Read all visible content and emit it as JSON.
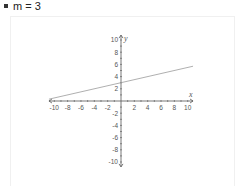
{
  "title": "m = 3",
  "chart_data": {
    "type": "line",
    "title": "m = 3",
    "xlabel": "x",
    "ylabel": "y",
    "xlim": [
      -10.8,
      10.8
    ],
    "ylim": [
      -10.8,
      10.8
    ],
    "x_ticks": [
      -10,
      -8,
      -6,
      -4,
      -2,
      2,
      4,
      6,
      8,
      10
    ],
    "y_ticks": [
      10,
      8,
      6,
      4,
      2,
      -2,
      -4,
      -6,
      -8,
      -10
    ],
    "grid": false,
    "series": [
      {
        "name": "line",
        "x": [
          -10.8,
          10.8
        ],
        "y": [
          0.3,
          5.7
        ],
        "color": "#9a9a9a"
      }
    ],
    "equation_approx": "y = 0.25x + 3"
  },
  "colors": {
    "axis": "#555555",
    "line": "#9a9a9a",
    "text": "#555555"
  }
}
